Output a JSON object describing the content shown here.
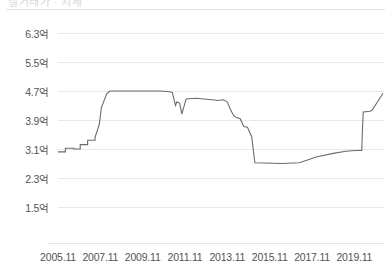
{
  "header": {
    "clipped_text": "실거래가  ·  시세"
  },
  "chart_data": {
    "type": "line",
    "title": "",
    "subtitle": "",
    "xlabel": "",
    "ylabel": "",
    "grid": true,
    "legend": null,
    "line_color": "#6b6b6b",
    "grid_color": "#e8e8e8",
    "axis_text_color": "#545454",
    "unit_suffix": "억",
    "ylim": [
      1.5,
      6.3
    ],
    "ytick_values": [
      6.3,
      5.5,
      4.7,
      3.9,
      3.1,
      2.3,
      1.5
    ],
    "ytick_labels": [
      "6.3억",
      "5.5억",
      "4.7억",
      "3.9억",
      "3.1억",
      "2.3억",
      "1.5억"
    ],
    "xtick_labels": [
      "2005.11",
      "2007.11",
      "2009.11",
      "2011.11",
      "2013.11",
      "2015.11",
      "2017.11",
      "2019.11"
    ],
    "xtick_positions": [
      0,
      2,
      4,
      6,
      8,
      10,
      12,
      14
    ],
    "xlim": [
      0,
      15.4
    ],
    "series": [
      {
        "name": "매매 실거래가",
        "x": [
          0.0,
          0.35,
          0.35,
          0.75,
          0.75,
          1.05,
          1.05,
          1.4,
          1.4,
          1.75,
          1.75,
          1.95,
          2.05,
          2.3,
          2.45,
          4.6,
          4.85,
          5.25,
          5.4,
          5.55,
          5.62,
          5.75,
          5.85,
          6.05,
          6.5,
          7.3,
          7.55,
          7.8,
          8.0,
          8.15,
          8.3,
          8.45,
          8.6,
          8.78,
          8.95,
          9.15,
          9.3,
          10.6,
          11.4,
          12.2,
          13.0,
          13.6,
          14.05,
          14.35,
          14.38,
          14.42,
          14.75,
          14.85,
          15.05,
          15.35
        ],
        "y": [
          3.02,
          3.02,
          3.12,
          3.12,
          3.1,
          3.1,
          3.22,
          3.22,
          3.34,
          3.34,
          3.42,
          3.78,
          4.24,
          4.62,
          4.7,
          4.7,
          4.7,
          4.68,
          4.66,
          4.3,
          4.4,
          4.36,
          4.06,
          4.48,
          4.5,
          4.46,
          4.44,
          4.46,
          4.4,
          4.18,
          4.02,
          3.96,
          3.94,
          3.72,
          3.7,
          3.44,
          2.72,
          2.7,
          2.72,
          2.88,
          2.98,
          3.04,
          3.06,
          3.06,
          3.6,
          4.12,
          4.14,
          4.18,
          4.36,
          4.64
        ]
      }
    ]
  }
}
